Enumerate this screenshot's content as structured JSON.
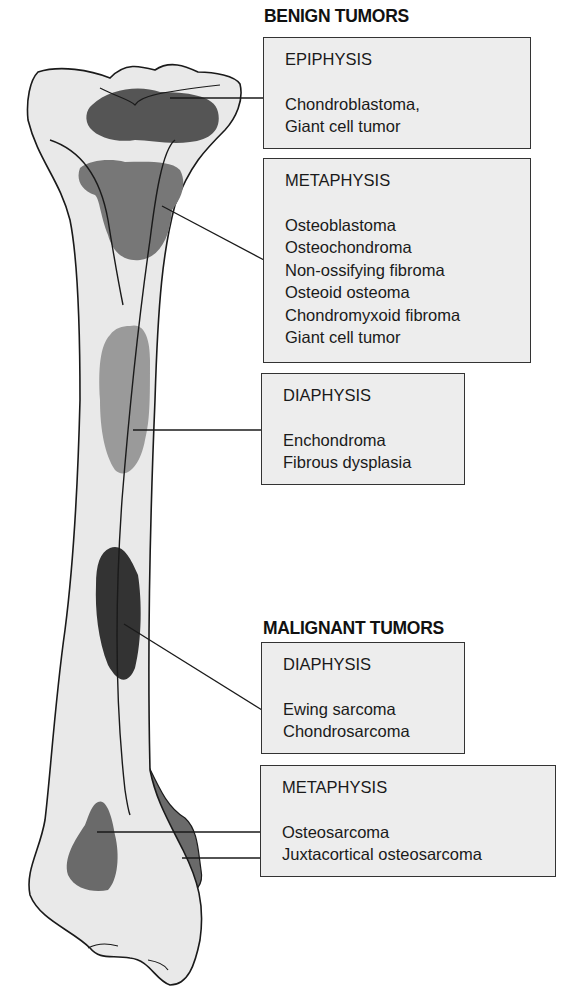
{
  "diagram": {
    "colors": {
      "bone_fill": "#e9e9e9",
      "outline": "#1a1a1a",
      "epiphysis_lesion": "#555555",
      "metaphysis_lesion": "#777777",
      "diaphysis_benign_lesion": "#9a9a9a",
      "diaphysis_malignant_lesion": "#333333",
      "box_fill": "#ededed"
    }
  },
  "benign": {
    "title": "BENIGN TUMORS",
    "epiphysis": {
      "region": "EPIPHYSIS",
      "items": [
        "Chondroblastoma,",
        "Giant cell tumor"
      ]
    },
    "metaphysis": {
      "region": "METAPHYSIS",
      "items": [
        "Osteoblastoma",
        "Osteochondroma",
        "Non-ossifying fibroma",
        "Osteoid osteoma",
        "Chondromyxoid fibroma",
        "Giant cell tumor"
      ]
    },
    "diaphysis": {
      "region": "DIAPHYSIS",
      "items": [
        "Enchondroma",
        "Fibrous dysplasia"
      ]
    }
  },
  "malignant": {
    "title": "MALIGNANT TUMORS",
    "diaphysis": {
      "region": "DIAPHYSIS",
      "items": [
        "Ewing sarcoma",
        "Chondrosarcoma"
      ]
    },
    "metaphysis": {
      "region": "METAPHYSIS",
      "items": [
        "Osteosarcoma",
        "Juxtacortical osteosarcoma"
      ]
    }
  }
}
